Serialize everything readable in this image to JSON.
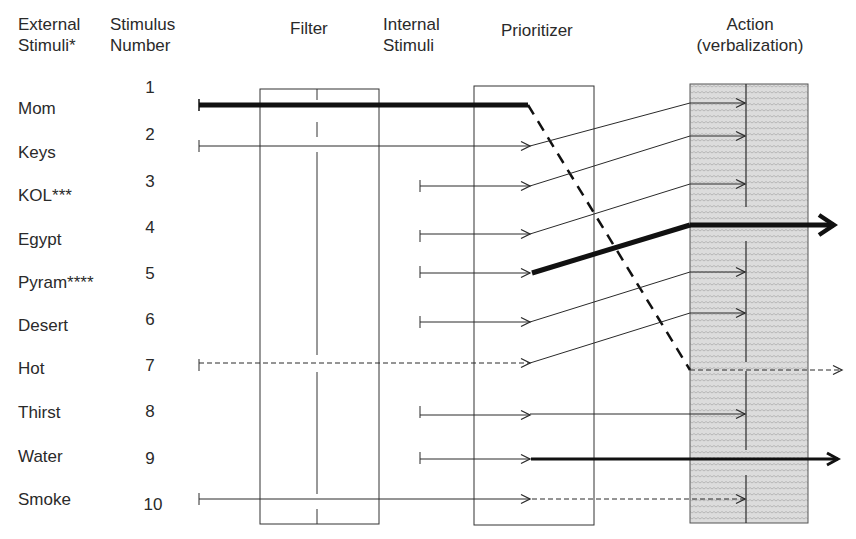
{
  "headers": {
    "external": [
      "External",
      "Stimuli*"
    ],
    "number": [
      "Stimulus",
      "Number"
    ],
    "filter": "Filter",
    "internal": [
      "Internal",
      "Stimuli"
    ],
    "prioritizer": "Prioritizer",
    "action": [
      "Action",
      "(verbalization)"
    ]
  },
  "rows": [
    {
      "label": "Mom",
      "number": "1"
    },
    {
      "label": "Keys",
      "number": "2"
    },
    {
      "label": "KOL***",
      "number": "3"
    },
    {
      "label": "Egypt",
      "number": "4"
    },
    {
      "label": "Pyram****",
      "number": "5"
    },
    {
      "label": "Desert",
      "number": "6"
    },
    {
      "label": "Hot",
      "number": "7"
    },
    {
      "label": "Thirst",
      "number": "8"
    },
    {
      "label": "Water",
      "number": "9"
    },
    {
      "label": "Smoke",
      "number": "10"
    }
  ],
  "colors": {
    "line": "#2a2a2a",
    "action_fill": "#d9d9d9"
  }
}
